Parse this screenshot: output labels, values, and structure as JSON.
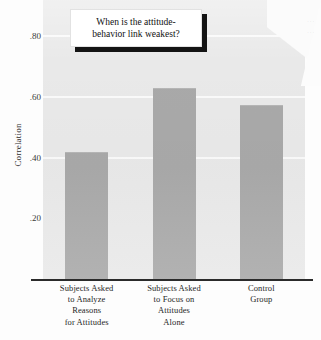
{
  "figure": {
    "callout_line1": "When is the attitude-",
    "callout_line2": "behavior link weakest?",
    "bleed_line1": "…",
    "bleed_line2": "…"
  },
  "chart_data": {
    "type": "bar",
    "xlabel": "",
    "ylabel": "Correlation",
    "categories": [
      "Subjects Asked to Analyze Reasons for Attitudes",
      "Subjects Asked to Focus on Attitudes Alone",
      "Control Group"
    ],
    "category_lines": [
      [
        "Subjects Asked",
        "to Analyze",
        "Reasons",
        "for Attitudes"
      ],
      [
        "Subjects Asked",
        "to Focus on",
        "Attitudes",
        "Alone"
      ],
      [
        "Control",
        "Group"
      ]
    ],
    "values": [
      0.42,
      0.63,
      0.575
    ],
    "ylim": [
      0.0,
      0.92
    ],
    "yticks": [
      0.8,
      0.6,
      0.4,
      0.2
    ],
    "ytick_labels": [
      ".80",
      ".60",
      ".40",
      ".20"
    ],
    "grid": true,
    "grid_color": "#fafafa",
    "legend": null,
    "bar_color": "#a9a9a9",
    "panel_color": "#e9e9e9",
    "axis_color": "#2b2b2b"
  }
}
